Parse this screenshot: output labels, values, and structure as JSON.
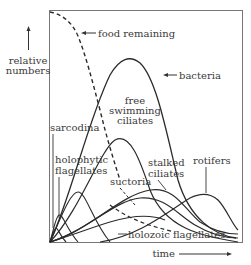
{
  "diagram": {
    "y_axis_label_line1": "relative",
    "y_axis_label_line2": "numbers",
    "x_axis_label": "time",
    "labels": {
      "food": "food remaining",
      "bacteria": "bacteria",
      "free_line1": "free",
      "free_line2": "swimming",
      "free_line3": "ciliates",
      "sarcodina": "sarcodina",
      "holophytic_line1": "holophytic",
      "holophytic_line2": "flagellates",
      "stalked_line1": "stalked",
      "stalked_line2": "ciliates",
      "suctoria": "suctoria",
      "rotifers": "rotifers",
      "holozoic": "holozoic flagellates"
    },
    "colors": {
      "line": "#2b2b2b",
      "frame": "#6a6a6a",
      "text": "#3a3a3a",
      "background": "#ffffff"
    }
  }
}
